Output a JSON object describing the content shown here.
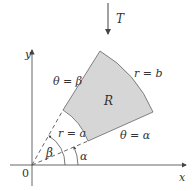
{
  "figure": {
    "transform_label": "T",
    "region_label": "R",
    "outer_arc_label": "r = b",
    "inner_arc_label": "r = a",
    "upper_ray_label": "θ = β",
    "lower_ray_label": "θ = α",
    "angle_beta_label": "β",
    "angle_alpha_label": "α",
    "origin_label": "0",
    "x_axis_label": "x",
    "y_axis_label": "y"
  },
  "colors": {
    "region_fill": "#d6d6d6",
    "stroke": "#555555",
    "text": "#333333"
  }
}
